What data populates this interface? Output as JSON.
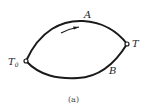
{
  "diagram": {
    "type": "thermodynamic-cycle-paths",
    "points": {
      "start": {
        "label": "T",
        "subscript": "0"
      },
      "end": {
        "label": "T"
      }
    },
    "paths": [
      {
        "name": "A",
        "label": "A",
        "position": "upper",
        "arrow": "left-to-right"
      },
      {
        "name": "B",
        "label": "B",
        "position": "lower"
      }
    ],
    "caption": "(a)",
    "colors": {
      "stroke": "#1a1a1a",
      "background": "#ffffff"
    }
  }
}
